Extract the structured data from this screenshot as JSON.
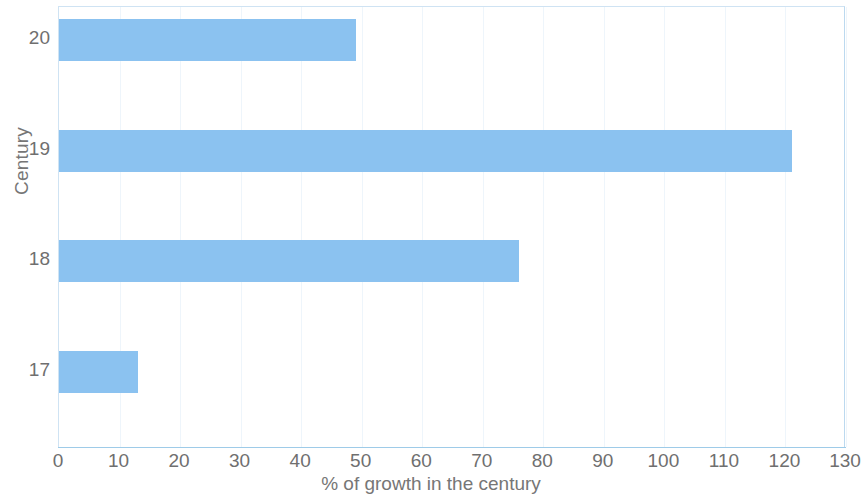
{
  "chart_data": {
    "type": "bar",
    "orientation": "horizontal",
    "title": "",
    "xlabel": "% of growth in the century",
    "ylabel": "Century",
    "categories": [
      "17",
      "18",
      "19",
      "20"
    ],
    "values": [
      13,
      76,
      121,
      49
    ],
    "series": [
      {
        "name": "% of growth in the century",
        "values": [
          13,
          76,
          121,
          49
        ]
      }
    ],
    "xlim": [
      0,
      130
    ],
    "xticks": [
      0,
      10,
      20,
      30,
      40,
      50,
      60,
      70,
      80,
      90,
      100,
      110,
      120,
      130
    ],
    "xtick_labels": [
      "0",
      "10",
      "20",
      "30",
      "40",
      "50",
      "60",
      "70",
      "80",
      "90",
      "100",
      "110",
      "120",
      "130"
    ],
    "ytick_labels": [
      "20",
      "19",
      "18",
      "17"
    ],
    "grid": "vertical-only",
    "legend": "none",
    "colors": {
      "bar": "#8bc2f0",
      "gridline": "#eef5fb",
      "plot_border": "#cfe3f3",
      "axis_line": "#9ecbe8",
      "tick_text": "#6f6f6f",
      "axis_title_text": "#767676",
      "background": "#ffffff"
    }
  },
  "axes": {
    "y_title": "Century",
    "x_title": "% of growth in the century"
  },
  "y_ticks": [
    {
      "label": "20"
    },
    {
      "label": "19"
    },
    {
      "label": "18"
    },
    {
      "label": "17"
    }
  ],
  "x_ticks": [
    {
      "label": "0"
    },
    {
      "label": "10"
    },
    {
      "label": "20"
    },
    {
      "label": "30"
    },
    {
      "label": "40"
    },
    {
      "label": "50"
    },
    {
      "label": "60"
    },
    {
      "label": "70"
    },
    {
      "label": "80"
    },
    {
      "label": "90"
    },
    {
      "label": "100"
    },
    {
      "label": "110"
    },
    {
      "label": "120"
    },
    {
      "label": "130"
    }
  ]
}
